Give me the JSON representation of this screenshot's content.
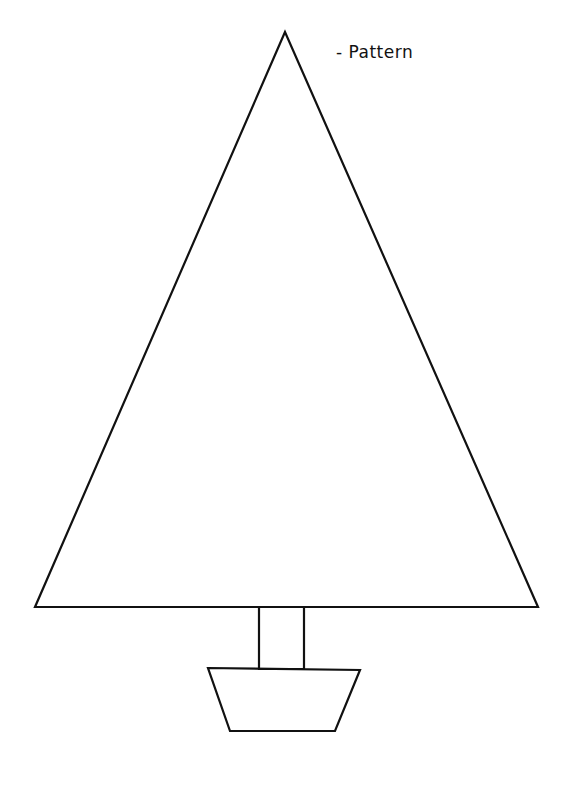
{
  "label": "- Pattern",
  "figure": {
    "parts": [
      "triangle-canopy",
      "rectangular-trunk",
      "trapezoid-pot"
    ],
    "stroke_color": "#111111",
    "background_color": "#ffffff"
  }
}
